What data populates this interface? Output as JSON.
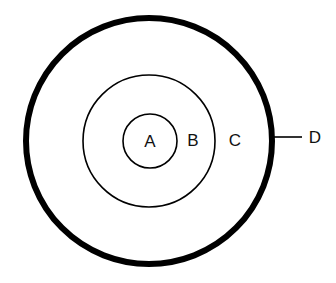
{
  "diagram": {
    "type": "concentric-circles",
    "labels": {
      "a": "A",
      "b": "B",
      "c": "C",
      "d": "D"
    },
    "regions": [
      {
        "label": "A",
        "description": "innermost circle"
      },
      {
        "label": "B",
        "description": "ring between inner and middle circle"
      },
      {
        "label": "C",
        "description": "ring between middle and outer circle"
      },
      {
        "label": "D",
        "description": "outer thick boundary, indicated by leader line"
      }
    ],
    "colors": {
      "stroke": "#000000",
      "background": "#ffffff"
    }
  }
}
